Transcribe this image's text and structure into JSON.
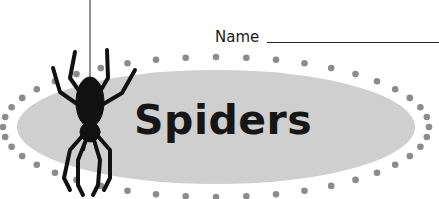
{
  "worksheet": {
    "name_label": "Name",
    "title": "Spiders"
  },
  "banner": {
    "ellipse_color": "#cfcfcf",
    "dot_color": "#8c8c8c"
  },
  "icons": {
    "spider": "spider-icon"
  }
}
